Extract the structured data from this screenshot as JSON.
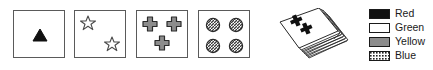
{
  "figure": {
    "cards": [
      {
        "name": "card-one-triangle-red",
        "count": 1,
        "shape": "triangle",
        "color": "Red",
        "fill": "#111111",
        "positions": [
          [
            18,
            16
          ]
        ]
      },
      {
        "name": "card-two-stars-green",
        "count": 2,
        "shape": "star",
        "color": "Green",
        "fill": "#ffffff",
        "positions": [
          [
            5,
            4
          ],
          [
            29,
            25
          ]
        ]
      },
      {
        "name": "card-three-crosses-yellow",
        "count": 3,
        "shape": "cross",
        "color": "Yellow",
        "fill": "#8c8c8c",
        "positions": [
          [
            5,
            5
          ],
          [
            29,
            5
          ],
          [
            17,
            24
          ]
        ]
      },
      {
        "name": "card-four-circles-blue",
        "count": 4,
        "shape": "circle",
        "color": "Blue",
        "fill": "hatch",
        "positions": [
          [
            6,
            6
          ],
          [
            29,
            6
          ],
          [
            6,
            27
          ],
          [
            29,
            27
          ]
        ]
      }
    ],
    "deck": {
      "name": "card-deck",
      "top_card_shape": "cross",
      "top_card_count": 2,
      "top_card_color": "Red"
    },
    "legend": {
      "name": "color-legend",
      "items": [
        {
          "label": "Red",
          "swatch": "solid-black",
          "color": "#111111"
        },
        {
          "label": "Green",
          "swatch": "outline-white",
          "color": "#ffffff"
        },
        {
          "label": "Yellow",
          "swatch": "solid-gray",
          "color": "#8c8c8c"
        },
        {
          "label": "Blue",
          "swatch": "hatched",
          "color": "#ffffff"
        }
      ]
    }
  }
}
